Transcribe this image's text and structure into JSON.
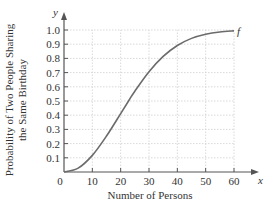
{
  "chart_data": {
    "type": "line",
    "title": "",
    "xlabel": "Number of Persons",
    "ylabel": "Probability of Two People Sharing the Same Birthday",
    "ylabel_lines": [
      "Probability of Two People Sharing",
      "the Same Birthday"
    ],
    "x_axis_var": "x",
    "y_axis_var": "y",
    "xlim": [
      0,
      60
    ],
    "ylim": [
      0,
      1.0
    ],
    "x_ticks": [
      "0",
      "10",
      "20",
      "30",
      "40",
      "50",
      "60"
    ],
    "y_ticks": [
      "0.1",
      "0.2",
      "0.3",
      "0.4",
      "0.5",
      "0.6",
      "0.7",
      "0.8",
      "0.9",
      "1.0"
    ],
    "grid": true,
    "legend": null,
    "series": [
      {
        "name": "f",
        "x": [
          0,
          5,
          10,
          15,
          20,
          23,
          25,
          30,
          35,
          40,
          45,
          50,
          55,
          60
        ],
        "values": [
          0,
          0.027,
          0.117,
          0.253,
          0.411,
          0.507,
          0.569,
          0.706,
          0.814,
          0.891,
          0.941,
          0.97,
          0.986,
          0.994
        ]
      }
    ],
    "annotations": [
      {
        "text": "f",
        "x": 60,
        "y": 0.994
      }
    ]
  }
}
